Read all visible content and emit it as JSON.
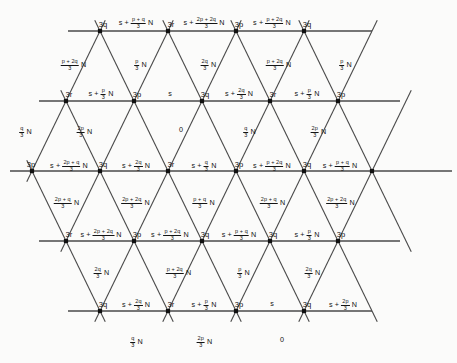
{
  "figure": {
    "type": "triangular-lattice-labeled-diagram",
    "background": "#fbfbfa",
    "line_color": "#4a4a4a",
    "vertex_color": "#111111",
    "width": 457,
    "height": 363,
    "symbols": {
      "s": "s",
      "N": "N",
      "p": "p",
      "q": "q",
      "r": "r",
      "denominator": "3"
    }
  },
  "lattice": {
    "horizontal_lines": [
      {
        "y": 31,
        "x1": 68,
        "x2": 372
      },
      {
        "y": 101,
        "x1": 39,
        "x2": 400
      },
      {
        "y": 171,
        "x1": 10,
        "x2": 452
      },
      {
        "y": 241,
        "x1": 39,
        "x2": 400
      },
      {
        "y": 311,
        "x1": 68,
        "x2": 372
      }
    ],
    "vertex_rows": [
      {
        "y": 31,
        "xs": [
          100,
          168,
          236,
          304
        ]
      },
      {
        "y": 101,
        "xs": [
          66,
          134,
          202,
          270,
          338
        ]
      },
      {
        "y": 171,
        "xs": [
          32,
          100,
          168,
          236,
          304,
          372
        ]
      },
      {
        "y": 241,
        "xs": [
          66,
          134,
          202,
          270,
          338
        ]
      },
      {
        "y": 311,
        "xs": [
          100,
          168,
          236,
          304
        ]
      }
    ]
  },
  "labels": {
    "nodes": [
      {
        "text": "3q",
        "x": 103,
        "y": 25
      },
      {
        "text": "3r",
        "x": 171,
        "y": 25
      },
      {
        "text": "3p",
        "x": 239,
        "y": 25
      },
      {
        "text": "3q",
        "x": 307,
        "y": 25
      },
      {
        "text": "3r",
        "x": 69,
        "y": 95
      },
      {
        "text": "3p",
        "x": 137,
        "y": 95
      },
      {
        "text": "3q",
        "x": 205,
        "y": 95
      },
      {
        "text": "3r",
        "x": 273,
        "y": 95
      },
      {
        "text": "3p",
        "x": 341,
        "y": 95
      },
      {
        "text": "3p",
        "x": 31,
        "y": 165
      },
      {
        "text": "3q",
        "x": 103,
        "y": 165
      },
      {
        "text": "3r",
        "x": 171,
        "y": 165
      },
      {
        "text": "3p",
        "x": 239,
        "y": 165
      },
      {
        "text": "3q",
        "x": 307,
        "y": 165
      },
      {
        "text": "3r",
        "x": 69,
        "y": 235
      },
      {
        "text": "3p",
        "x": 137,
        "y": 235
      },
      {
        "text": "3q",
        "x": 205,
        "y": 235
      },
      {
        "text": "3q",
        "x": 273,
        "y": 235
      },
      {
        "text": "3p",
        "x": 341,
        "y": 235
      },
      {
        "text": "3q",
        "x": 103,
        "y": 305
      },
      {
        "text": "3r",
        "x": 171,
        "y": 305
      },
      {
        "text": "3p",
        "x": 239,
        "y": 305
      },
      {
        "text": "3q",
        "x": 307,
        "y": 305
      }
    ],
    "expressions": [
      {
        "x": 136,
        "y": 23,
        "lead": "s +",
        "num": "p + q",
        "den": "3",
        "tail": "N"
      },
      {
        "x": 204,
        "y": 23,
        "lead": "s +",
        "num": "2p + 2q",
        "den": "3",
        "tail": "N"
      },
      {
        "x": 272,
        "y": 23,
        "lead": "s +",
        "num": "p + 2q",
        "den": "3",
        "tail": "N"
      },
      {
        "x": 73,
        "y": 64,
        "lead": "",
        "num": "p + 2q",
        "den": "3",
        "tail": "N"
      },
      {
        "x": 140,
        "y": 64,
        "lead": "",
        "num": "p",
        "den": "3",
        "tail": "N"
      },
      {
        "x": 208,
        "y": 64,
        "lead": "",
        "num": "2q",
        "den": "3",
        "tail": "N"
      },
      {
        "x": 278,
        "y": 64,
        "lead": "",
        "num": "p + 2q",
        "den": "3",
        "tail": "N"
      },
      {
        "x": 345,
        "y": 64,
        "lead": "",
        "num": "p",
        "den": "3",
        "tail": "N"
      },
      {
        "x": 101,
        "y": 94,
        "lead": "s +",
        "num": "p",
        "den": "3",
        "tail": "N"
      },
      {
        "x": 170,
        "y": 94,
        "lead": "s",
        "num": "",
        "den": "",
        "tail": ""
      },
      {
        "x": 239,
        "y": 94,
        "lead": "s +",
        "num": "2q",
        "den": "3",
        "tail": "N"
      },
      {
        "x": 307,
        "y": 94,
        "lead": "s +",
        "num": "p",
        "den": "3",
        "tail": "N"
      },
      {
        "x": 25,
        "y": 131,
        "lead": "",
        "num": "q",
        "den": "3",
        "tail": "N"
      },
      {
        "x": 84,
        "y": 131,
        "lead": "",
        "num": "2p",
        "den": "3",
        "tail": "N"
      },
      {
        "x": 181,
        "y": 130,
        "lead": "0",
        "num": "",
        "den": "",
        "tail": ""
      },
      {
        "x": 249,
        "y": 131,
        "lead": "",
        "num": "q",
        "den": "3",
        "tail": "N"
      },
      {
        "x": 318,
        "y": 131,
        "lead": "",
        "num": "2p",
        "den": "3",
        "tail": "N"
      },
      {
        "x": 69,
        "y": 166,
        "lead": "s +",
        "num": "2p + q",
        "den": "3",
        "tail": "N"
      },
      {
        "x": 136,
        "y": 166,
        "lead": "s +",
        "num": "2q",
        "den": "3",
        "tail": "N"
      },
      {
        "x": 204,
        "y": 166,
        "lead": "s +",
        "num": "q",
        "den": "3",
        "tail": "N"
      },
      {
        "x": 272,
        "y": 166,
        "lead": "s +",
        "num": "p + 2q",
        "den": "3",
        "tail": "N"
      },
      {
        "x": 340,
        "y": 166,
        "lead": "s +",
        "num": "p + q",
        "den": "3",
        "tail": "N"
      },
      {
        "x": 66,
        "y": 202,
        "lead": "",
        "num": "2p + q",
        "den": "3",
        "tail": "N"
      },
      {
        "x": 135,
        "y": 202,
        "lead": "",
        "num": "2p + 2q",
        "den": "3",
        "tail": "N"
      },
      {
        "x": 203,
        "y": 202,
        "lead": "",
        "num": "p + q",
        "den": "3",
        "tail": "N"
      },
      {
        "x": 272,
        "y": 202,
        "lead": "",
        "num": "2p + q",
        "den": "3",
        "tail": "N"
      },
      {
        "x": 340,
        "y": 202,
        "lead": "",
        "num": "2p + 2q",
        "den": "3",
        "tail": "N"
      },
      {
        "x": 101,
        "y": 235,
        "lead": "s +",
        "num": "2p + 2q",
        "den": "3",
        "tail": "N"
      },
      {
        "x": 170,
        "y": 235,
        "lead": "s +",
        "num": "p + 2q",
        "den": "3",
        "tail": "N"
      },
      {
        "x": 239,
        "y": 235,
        "lead": "s +",
        "num": "p + q",
        "den": "3",
        "tail": "N"
      },
      {
        "x": 307,
        "y": 235,
        "lead": "s +",
        "num": "p",
        "den": "3",
        "tail": "N"
      },
      {
        "x": 101,
        "y": 272,
        "lead": "",
        "num": "2q",
        "den": "3",
        "tail": "N"
      },
      {
        "x": 178,
        "y": 272,
        "lead": "",
        "num": "p + 2q",
        "den": "3",
        "tail": "N"
      },
      {
        "x": 243,
        "y": 272,
        "lead": "",
        "num": "p",
        "den": "3",
        "tail": "N"
      },
      {
        "x": 312,
        "y": 272,
        "lead": "",
        "num": "2q",
        "den": "3",
        "tail": "N"
      },
      {
        "x": 136,
        "y": 305,
        "lead": "s +",
        "num": "2q",
        "den": "3",
        "tail": "N"
      },
      {
        "x": 204,
        "y": 305,
        "lead": "s +",
        "num": "p",
        "den": "3",
        "tail": "N"
      },
      {
        "x": 272,
        "y": 304,
        "lead": "s",
        "num": "",
        "den": "",
        "tail": ""
      },
      {
        "x": 343,
        "y": 305,
        "lead": "s +",
        "num": "2p",
        "den": "3",
        "tail": "N"
      },
      {
        "x": 136,
        "y": 341,
        "lead": "",
        "num": "q",
        "den": "3",
        "tail": "N"
      },
      {
        "x": 204,
        "y": 341,
        "lead": "",
        "num": "2p",
        "den": "3",
        "tail": "N"
      },
      {
        "x": 282,
        "y": 340,
        "lead": "0",
        "num": "",
        "den": "",
        "tail": ""
      }
    ]
  }
}
